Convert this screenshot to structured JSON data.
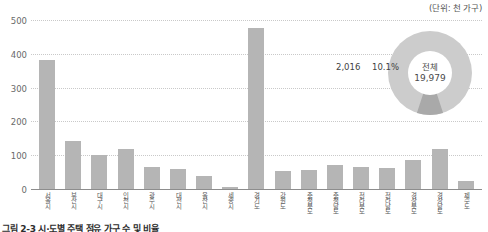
{
  "unit_note": "(단위: 천 가구)",
  "caption": "그림 2-3 시·도별 주택 점유 가구 수 및 비율",
  "chart_data": {
    "type": "bar",
    "title": "",
    "xlabel": "",
    "ylabel": "",
    "ylim": [
      0,
      500
    ],
    "yticks": [
      0,
      100,
      200,
      300,
      400,
      500
    ],
    "grid": true,
    "legend": "none",
    "categories": [
      "서울시",
      "부산시",
      "대구시",
      "인천시",
      "광주시",
      "대전시",
      "울산시",
      "세종시",
      "경기도",
      "강원도",
      "충청북도",
      "충청남도",
      "전라북도",
      "전라남도",
      "경상북도",
      "경상남도",
      "제주도"
    ],
    "values": [
      385,
      143,
      102,
      120,
      67,
      59,
      39,
      7,
      478,
      55,
      57,
      72,
      65,
      63,
      85,
      119,
      25
    ],
    "series": [
      {
        "name": "가구 수",
        "values": [
          385,
          143,
          102,
          120,
          67,
          59,
          39,
          7,
          478,
          55,
          57,
          72,
          65,
          63,
          85,
          119,
          25
        ]
      }
    ]
  },
  "donut": {
    "type": "pie",
    "center_label": "전체",
    "center_value": "19,979",
    "slice_value_label": "2,016",
    "slice_percent_label": "10.1%",
    "slices": [
      {
        "name": "해당",
        "value": 2016,
        "percent": 10.1,
        "color": "#a9a9a9"
      },
      {
        "name": "기타",
        "value": 17963,
        "percent": 89.9,
        "color": "#cccccc"
      }
    ]
  },
  "colors": {
    "bar": "#b5b5b5",
    "gridline": "#c9c9c9",
    "axis": "#8d8d8d",
    "donut_major": "#cccccc",
    "donut_minor": "#a9a9a9",
    "text": "#4d4d4d"
  }
}
